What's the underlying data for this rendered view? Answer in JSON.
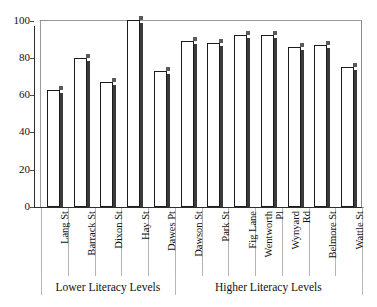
{
  "chart_data": {
    "type": "bar",
    "title": "",
    "xlabel": "",
    "ylabel": "",
    "ylim": [
      0,
      100
    ],
    "yticks": [
      0,
      20,
      40,
      60,
      80,
      100
    ],
    "grid": false,
    "legend": null,
    "categories": [
      "Lang St",
      "Barrack St",
      "Dixon St",
      "Hay St",
      "Dawes Pt",
      "Dawson St",
      "Park St",
      "Fig Lane",
      "Wentworth Pl",
      "Wynyard Rd",
      "Belmore St",
      "Wattle St"
    ],
    "values": [
      63,
      80,
      67,
      100,
      73,
      89,
      88,
      92,
      92,
      86,
      87,
      75
    ],
    "groups": [
      {
        "label": "Lower Literacy Levels",
        "start_index": 0,
        "end_index": 4
      },
      {
        "label": "Higher Literacy Levels",
        "start_index": 5,
        "end_index": 11
      }
    ],
    "bar_face_color": "#ffffff",
    "bar_edge_color": "#1c1c1c",
    "bar_shadow_color": "#3a3a3a",
    "axis_color": "#2e2e2e"
  },
  "axis": {
    "y_tick_labels": [
      "100",
      "80",
      "60",
      "40",
      "20",
      "0"
    ]
  },
  "x_tick_labels": [
    {
      "text": "Lang St",
      "lines": [
        "Lang St"
      ]
    },
    {
      "text": "Barrack St",
      "lines": [
        "Barrack St"
      ]
    },
    {
      "text": "Dixon St",
      "lines": [
        "Dixon St"
      ]
    },
    {
      "text": "Hay St",
      "lines": [
        "Hay St"
      ]
    },
    {
      "text": "Dawes Pt",
      "lines": [
        "Dawes Pt"
      ]
    },
    {
      "text": "Dawson St",
      "lines": [
        "Dawson St"
      ]
    },
    {
      "text": "Park St",
      "lines": [
        "Park St"
      ]
    },
    {
      "text": "Fig Lane",
      "lines": [
        "Fig Lane"
      ]
    },
    {
      "text": "Wentworth Pl",
      "lines": [
        "Wentworth",
        "Pl"
      ]
    },
    {
      "text": "Wynyard Rd",
      "lines": [
        "Wynyard",
        "Rd"
      ]
    },
    {
      "text": "Belmore St",
      "lines": [
        "Belmore St"
      ]
    },
    {
      "text": "Wattle St",
      "lines": [
        "Wattle St"
      ]
    }
  ],
  "group_labels": [
    {
      "label": "Lower Literacy Levels"
    },
    {
      "label": "Higher Literacy Levels"
    }
  ]
}
